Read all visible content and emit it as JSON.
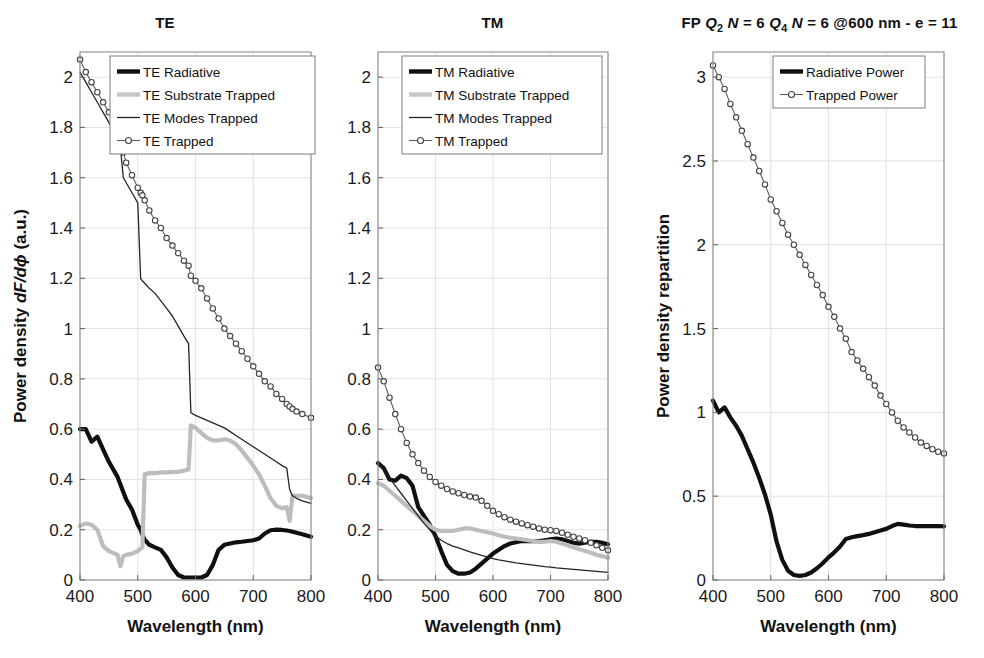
{
  "figure": {
    "width": 984,
    "height": 658,
    "background": "#ffffff"
  },
  "colors": {
    "radiative": "#101010",
    "substrate": "#bdbdbd",
    "modes": "#242424",
    "trapped": "#5d5d5d",
    "grid": "#e2e2e2",
    "axis": "#8c8c8c"
  },
  "chart_data": [
    {
      "type": "line",
      "panel": "TE",
      "title": "TE",
      "xlabel": "Wavelength (nm)",
      "ylabel": "Power density dF/dϕ (a.u.)",
      "ylabel_parts": {
        "prefix": "Power density ",
        "italic": "dF/dϕ",
        "suffix": " (a.u.)"
      },
      "xlim": [
        400,
        800
      ],
      "ylim": [
        0,
        2.1
      ],
      "xticks": [
        400,
        500,
        600,
        700,
        800
      ],
      "yticks": [
        0,
        0.2,
        0.4,
        0.6,
        0.8,
        1,
        1.2,
        1.4,
        1.6,
        1.8,
        2
      ],
      "yticklabels": [
        "0",
        "0.2",
        "0.4",
        "0.6",
        "0.8",
        "1",
        "1.2",
        "1.4",
        "1.6",
        "1.8",
        "2"
      ],
      "grid": true,
      "legend_position": "top-right",
      "x": [
        400,
        410,
        420,
        430,
        440,
        450,
        460,
        465,
        470,
        475,
        480,
        490,
        500,
        505,
        508,
        512,
        520,
        530,
        540,
        550,
        560,
        570,
        580,
        588,
        592,
        600,
        610,
        620,
        630,
        640,
        650,
        660,
        670,
        680,
        690,
        700,
        710,
        720,
        730,
        740,
        750,
        758,
        763,
        768,
        775,
        785,
        800
      ],
      "series": [
        {
          "name": "TE Radiative",
          "style": "thick-black",
          "marker": "none",
          "values": [
            0.6,
            0.6,
            0.55,
            0.57,
            0.52,
            0.47,
            0.43,
            0.41,
            0.38,
            0.35,
            0.32,
            0.28,
            0.22,
            0.2,
            0.18,
            0.16,
            0.14,
            0.13,
            0.12,
            0.09,
            0.05,
            0.02,
            0.01,
            0.01,
            0.01,
            0.01,
            0.01,
            0.02,
            0.06,
            0.12,
            0.14,
            0.145,
            0.15,
            0.152,
            0.155,
            0.158,
            0.165,
            0.185,
            0.198,
            0.2,
            0.199,
            0.197,
            0.195,
            0.192,
            0.188,
            0.182,
            0.172
          ]
        },
        {
          "name": "TE Substrate Trapped",
          "style": "thick-gray",
          "marker": "none",
          "values": [
            0.215,
            0.225,
            0.22,
            0.2,
            0.135,
            0.115,
            0.105,
            0.1,
            0.055,
            0.095,
            0.1,
            0.105,
            0.115,
            0.125,
            0.13,
            0.42,
            0.425,
            0.425,
            0.428,
            0.428,
            0.43,
            0.43,
            0.435,
            0.44,
            0.615,
            0.605,
            0.585,
            0.565,
            0.555,
            0.555,
            0.56,
            0.555,
            0.54,
            0.515,
            0.485,
            0.455,
            0.42,
            0.375,
            0.325,
            0.295,
            0.285,
            0.29,
            0.235,
            0.335,
            0.335,
            0.335,
            0.325
          ]
        },
        {
          "name": "TE Modes Trapped",
          "style": "thin-black",
          "marker": "none",
          "values": [
            2.02,
            1.98,
            1.94,
            1.9,
            1.86,
            1.82,
            1.78,
            1.76,
            1.72,
            1.6,
            1.58,
            1.54,
            1.5,
            1.2,
            1.19,
            1.18,
            1.16,
            1.14,
            1.11,
            1.08,
            1.05,
            1.01,
            0.97,
            0.94,
            0.665,
            0.655,
            0.645,
            0.635,
            0.625,
            0.615,
            0.605,
            0.59,
            0.575,
            0.56,
            0.545,
            0.53,
            0.515,
            0.5,
            0.485,
            0.47,
            0.455,
            0.445,
            0.36,
            0.335,
            0.325,
            0.315,
            0.305
          ]
        },
        {
          "name": "TE Trapped",
          "style": "thin-marker",
          "marker": "circle",
          "values": [
            2.07,
            2.02,
            1.98,
            1.94,
            1.9,
            1.86,
            1.82,
            1.79,
            1.74,
            1.7,
            1.66,
            1.61,
            1.56,
            1.54,
            1.53,
            1.51,
            1.47,
            1.43,
            1.4,
            1.36,
            1.33,
            1.3,
            1.27,
            1.25,
            1.21,
            1.19,
            1.16,
            1.12,
            1.08,
            1.04,
            1.0,
            0.97,
            0.94,
            0.91,
            0.88,
            0.85,
            0.82,
            0.79,
            0.77,
            0.74,
            0.72,
            0.7,
            0.69,
            0.68,
            0.67,
            0.66,
            0.645
          ]
        }
      ],
      "legend": [
        {
          "label": "TE Radiative",
          "style": "thick-black",
          "marker": "none"
        },
        {
          "label": "TE Substrate Trapped",
          "style": "thick-gray",
          "marker": "none"
        },
        {
          "label": "TE Modes Trapped",
          "style": "thin-black",
          "marker": "none"
        },
        {
          "label": "TE Trapped",
          "style": "thin-marker",
          "marker": "circle"
        }
      ]
    },
    {
      "type": "line",
      "panel": "TM",
      "title": "TM",
      "xlabel": "Wavelength (nm)",
      "ylabel": "",
      "xlim": [
        400,
        800
      ],
      "ylim": [
        0,
        2.1
      ],
      "xticks": [
        400,
        500,
        600,
        700,
        800
      ],
      "yticks": [
        0,
        0.2,
        0.4,
        0.6,
        0.8,
        1,
        1.2,
        1.4,
        1.6,
        1.8,
        2
      ],
      "yticklabels": [
        "0",
        "0.2",
        "0.4",
        "0.6",
        "0.8",
        "1",
        "1.2",
        "1.4",
        "1.6",
        "1.8",
        "2"
      ],
      "grid": true,
      "legend_position": "top-right",
      "x": [
        400,
        410,
        420,
        430,
        440,
        450,
        460,
        470,
        480,
        490,
        500,
        510,
        520,
        530,
        540,
        550,
        560,
        570,
        580,
        590,
        600,
        610,
        620,
        630,
        640,
        650,
        660,
        670,
        680,
        690,
        700,
        710,
        720,
        730,
        740,
        750,
        760,
        770,
        780,
        790,
        800
      ],
      "series": [
        {
          "name": "TM Radiative",
          "style": "thick-black",
          "marker": "none",
          "values": [
            0.465,
            0.445,
            0.4,
            0.395,
            0.415,
            0.405,
            0.375,
            0.29,
            0.255,
            0.22,
            0.175,
            0.115,
            0.06,
            0.035,
            0.025,
            0.025,
            0.03,
            0.045,
            0.065,
            0.085,
            0.105,
            0.12,
            0.135,
            0.145,
            0.15,
            0.155,
            0.155,
            0.155,
            0.155,
            0.158,
            0.162,
            0.165,
            0.162,
            0.155,
            0.148,
            0.145,
            0.148,
            0.152,
            0.152,
            0.148,
            0.142
          ]
        },
        {
          "name": "TM Substrate Trapped",
          "style": "thick-gray",
          "marker": "none",
          "values": [
            0.385,
            0.375,
            0.355,
            0.335,
            0.315,
            0.295,
            0.275,
            0.255,
            0.235,
            0.215,
            0.2,
            0.195,
            0.195,
            0.195,
            0.2,
            0.205,
            0.205,
            0.2,
            0.195,
            0.19,
            0.185,
            0.178,
            0.172,
            0.168,
            0.165,
            0.162,
            0.158,
            0.155,
            0.152,
            0.152,
            0.155,
            0.152,
            0.145,
            0.138,
            0.13,
            0.122,
            0.115,
            0.108,
            0.1,
            0.095,
            0.088
          ]
        },
        {
          "name": "TM Modes Trapped",
          "style": "thin-black",
          "marker": "none",
          "values": [
            0.465,
            0.435,
            0.405,
            0.375,
            0.345,
            0.315,
            0.285,
            0.255,
            0.225,
            0.2,
            0.175,
            0.158,
            0.145,
            0.135,
            0.128,
            0.12,
            0.112,
            0.105,
            0.098,
            0.092,
            0.085,
            0.08,
            0.076,
            0.072,
            0.068,
            0.065,
            0.062,
            0.059,
            0.056,
            0.053,
            0.051,
            0.048,
            0.046,
            0.044,
            0.042,
            0.04,
            0.038,
            0.036,
            0.034,
            0.032,
            0.03
          ]
        },
        {
          "name": "TM Trapped",
          "style": "thin-marker",
          "marker": "circle",
          "values": [
            0.845,
            0.79,
            0.725,
            0.66,
            0.6,
            0.545,
            0.5,
            0.465,
            0.435,
            0.41,
            0.39,
            0.375,
            0.362,
            0.352,
            0.345,
            0.338,
            0.332,
            0.328,
            0.315,
            0.295,
            0.275,
            0.262,
            0.25,
            0.24,
            0.232,
            0.225,
            0.218,
            0.212,
            0.205,
            0.2,
            0.198,
            0.195,
            0.188,
            0.18,
            0.172,
            0.165,
            0.158,
            0.148,
            0.138,
            0.128,
            0.118
          ]
        }
      ],
      "legend": [
        {
          "label": "TM Radiative",
          "style": "thick-black",
          "marker": "none"
        },
        {
          "label": "TM Substrate Trapped",
          "style": "thick-gray",
          "marker": "none"
        },
        {
          "label": "TM Modes Trapped",
          "style": "thin-black",
          "marker": "none"
        },
        {
          "label": "TM Trapped",
          "style": "thin-marker",
          "marker": "circle"
        }
      ]
    },
    {
      "type": "line",
      "panel": "FP",
      "title": "FP Q2 N = 6 Q4 N = 6 @600 nm - e = 11",
      "title_parts": {
        "p1": "FP ",
        "q1": "Q",
        "q1sub": "2",
        "n1": " N",
        "eq1": " = 6 ",
        "q2": "Q",
        "q2sub": "4",
        "n2": " N",
        "eq2": " = 6 @600 nm - e = 11"
      },
      "xlabel": "Wavelength (nm)",
      "ylabel": "Power density repartition",
      "xlim": [
        400,
        800
      ],
      "ylim": [
        0,
        3.15
      ],
      "xticks": [
        400,
        500,
        600,
        700,
        800
      ],
      "yticks": [
        0,
        0.5,
        1,
        1.5,
        2,
        2.5,
        3
      ],
      "yticklabels": [
        "0",
        "0.5",
        "1",
        "1.5",
        "2",
        "2.5",
        "3"
      ],
      "grid": true,
      "legend_position": "top-right",
      "x": [
        400,
        410,
        420,
        430,
        440,
        450,
        460,
        470,
        480,
        490,
        500,
        510,
        520,
        530,
        540,
        550,
        560,
        570,
        580,
        590,
        600,
        610,
        620,
        630,
        640,
        650,
        660,
        670,
        680,
        690,
        700,
        710,
        720,
        730,
        740,
        750,
        760,
        770,
        780,
        790,
        800
      ],
      "series": [
        {
          "name": "Radiative Power",
          "style": "thick-black",
          "marker": "none",
          "values": [
            1.07,
            1.0,
            1.03,
            0.97,
            0.92,
            0.86,
            0.78,
            0.7,
            0.61,
            0.51,
            0.39,
            0.23,
            0.12,
            0.055,
            0.03,
            0.025,
            0.03,
            0.045,
            0.07,
            0.1,
            0.135,
            0.165,
            0.2,
            0.245,
            0.255,
            0.262,
            0.268,
            0.275,
            0.285,
            0.295,
            0.305,
            0.322,
            0.335,
            0.33,
            0.325,
            0.322,
            0.322,
            0.322,
            0.322,
            0.322,
            0.32
          ]
        },
        {
          "name": "Trapped Power",
          "style": "thin-marker",
          "marker": "circle",
          "values": [
            3.07,
            3.0,
            2.93,
            2.84,
            2.76,
            2.68,
            2.6,
            2.52,
            2.44,
            2.36,
            2.27,
            2.2,
            2.13,
            2.06,
            2.0,
            1.94,
            1.88,
            1.82,
            1.76,
            1.7,
            1.63,
            1.57,
            1.5,
            1.44,
            1.36,
            1.31,
            1.26,
            1.21,
            1.16,
            1.1,
            1.05,
            1.0,
            0.95,
            0.91,
            0.88,
            0.85,
            0.82,
            0.8,
            0.78,
            0.765,
            0.755
          ]
        }
      ],
      "legend": [
        {
          "label": "Radiative Power",
          "style": "thick-black",
          "marker": "none"
        },
        {
          "label": "Trapped Power",
          "style": "thin-marker",
          "marker": "circle"
        }
      ]
    }
  ]
}
